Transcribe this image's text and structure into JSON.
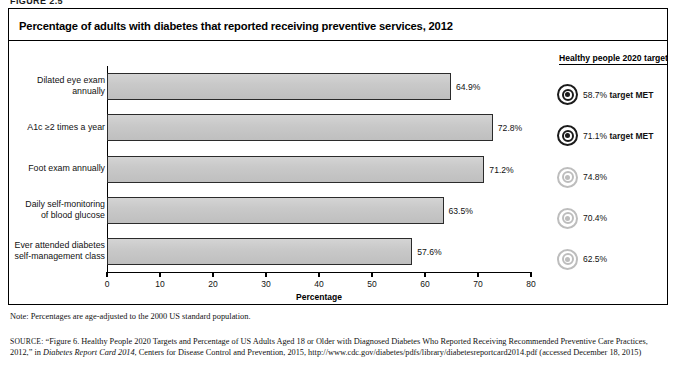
{
  "figure": {
    "label": "FIGURE 2.5",
    "title": "Percentage of adults with diabetes that reported receiving preventive services, 2012"
  },
  "legend": {
    "header": "Healthy people 2020 target"
  },
  "notes": {
    "note": "Note: Percentages are age-adjusted to the 2000 US standard population.",
    "source_prefix": "SOURCE:",
    "source_part1": " “Figure 6. Healthy People 2020 Targets and Percentage of US Adults Aged 18 or Older with Diagnosed Diabetes Who Reported Receiving Recommended Preventive Care Practices, 2012,” in ",
    "source_italic": "Diabetes Report Card 2014",
    "source_part2": ", Centers for Disease Control and Prevention, 2015, http://www.cdc.gov/diabetes/pdfs/library/diabetesreportcard2014.pdf (accessed December 18, 2015)"
  },
  "chart_data": {
    "type": "bar",
    "orientation": "horizontal",
    "title": "Percentage of adults with diabetes that reported receiving preventive services, 2012",
    "xlabel": "Percentage",
    "ylabel": "",
    "xlim": [
      0,
      80
    ],
    "xticks": [
      0,
      10,
      20,
      30,
      40,
      50,
      60,
      70,
      80
    ],
    "grid": false,
    "legend_position": "right",
    "categories": [
      "Dilated eye exam annually",
      "A1c ≥2 times a year",
      "Foot exam annually",
      "Daily self-monitoring of blood glucose",
      "Ever attended diabetes self-management class"
    ],
    "category_lines": [
      [
        "Dilated eye exam",
        "annually"
      ],
      [
        "A1c ≥2 times a year"
      ],
      [
        "Foot exam annually"
      ],
      [
        "Daily self-monitoring",
        "of blood glucose"
      ],
      [
        "Ever attended diabetes",
        "self-management class"
      ]
    ],
    "values": [
      64.9,
      72.8,
      71.2,
      63.5,
      57.6
    ],
    "value_labels": [
      "64.9%",
      "72.8%",
      "71.2%",
      "63.5%",
      "57.6%"
    ],
    "series": [
      {
        "name": "Percentage reported receiving service",
        "values": [
          64.9,
          72.8,
          71.2,
          63.5,
          57.6
        ]
      }
    ],
    "targets": [
      58.7,
      71.1,
      74.8,
      70.4,
      62.5
    ],
    "target_labels": [
      "58.7%",
      "71.1%",
      "74.8%",
      "70.4%",
      "62.5%"
    ],
    "target_met": [
      true,
      true,
      false,
      false,
      false
    ],
    "target_met_text": "target MET",
    "target_rows": [
      {
        "value_label": "58.7%",
        "met_label": " target MET",
        "met": true
      },
      {
        "value_label": "71.1%",
        "met_label": " target MET",
        "met": true
      },
      {
        "value_label": "74.8%",
        "met_label": "",
        "met": false
      },
      {
        "value_label": "70.4%",
        "met_label": "",
        "met": false
      },
      {
        "value_label": "62.5%",
        "met_label": "",
        "met": false
      }
    ],
    "colors": {
      "bar_fill": "#c9c9c9",
      "bar_border": "#2b2b2b",
      "target_met": "#1b1b1b",
      "target_unmet": "#bdbdbd",
      "axis": "#000000",
      "text": "#111111"
    }
  }
}
